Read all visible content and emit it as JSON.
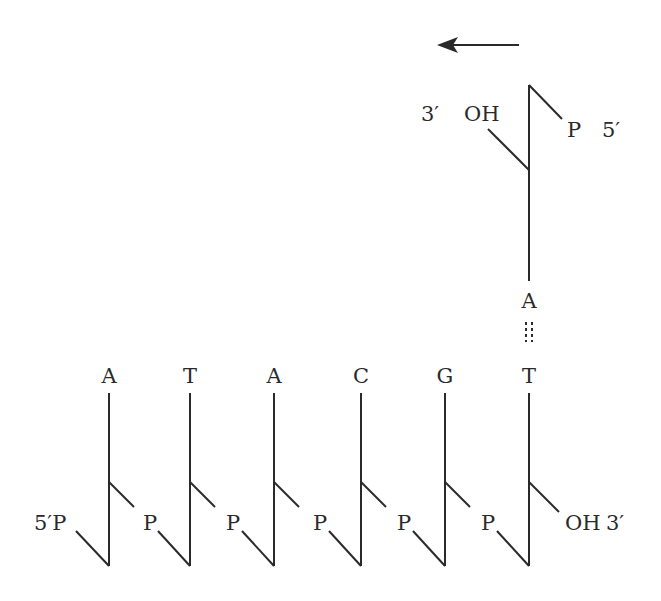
{
  "diagram": {
    "direction_arrow": {
      "x1": 519,
      "x2": 437,
      "y": 45,
      "meaning": "synthesis direction (leftward)"
    },
    "top_strand": {
      "x": 529,
      "top_y": 85,
      "kink_y": 170,
      "bottom_y": 281,
      "three_prime_label": "3′",
      "oh_label": "OH",
      "p_label": "P",
      "five_prime_label": "5′",
      "base": "A"
    },
    "base_pair": {
      "top_base": "A",
      "bottom_base": "T",
      "bond": "hydrogen-bond-dotted"
    },
    "bottom_strand": {
      "five_prime_label": "5′P",
      "three_prime_oh_label": "OH",
      "three_prime_label": "3′",
      "phosphate_label": "P",
      "bases": [
        {
          "letter": "A",
          "x": 109
        },
        {
          "letter": "T",
          "x": 190
        },
        {
          "letter": "A",
          "x": 274
        },
        {
          "letter": "C",
          "x": 361
        },
        {
          "letter": "G",
          "x": 445
        },
        {
          "letter": "T",
          "x": 529
        }
      ],
      "top_y": 393,
      "kink_y": 482,
      "bottom_y": 566
    }
  }
}
